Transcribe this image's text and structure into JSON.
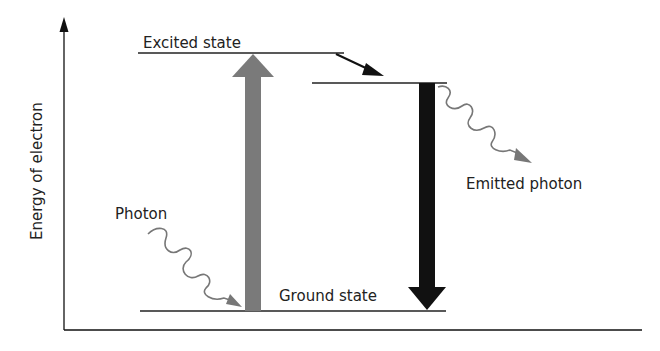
{
  "diagram": {
    "type": "energy-level-diagram",
    "y_axis_label": "Energy of electron",
    "levels": {
      "excited": "Excited state",
      "ground": "Ground state"
    },
    "labels": {
      "absorbed_photon": "Photon",
      "emitted_photon": "Emitted photon"
    },
    "colors": {
      "absorption_arrow": "#7a7a7a",
      "emission_arrow": "#111111",
      "photon_wave": "#777777",
      "lines": "#222222"
    }
  }
}
